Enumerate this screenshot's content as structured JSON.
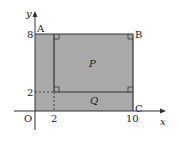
{
  "diagram": {
    "axes": {
      "x_label": "x",
      "y_label": "y",
      "origin_label": "O"
    },
    "ticks": {
      "x": [
        "2",
        "10"
      ],
      "y": [
        "2",
        "8"
      ]
    },
    "points": {
      "A": "A",
      "B": "B",
      "C": "C"
    },
    "regions": {
      "P": "P",
      "Q": "Q"
    },
    "colors": {
      "fill": "#a9a9a9",
      "stroke": "#333333",
      "background": "#ffffff"
    }
  }
}
